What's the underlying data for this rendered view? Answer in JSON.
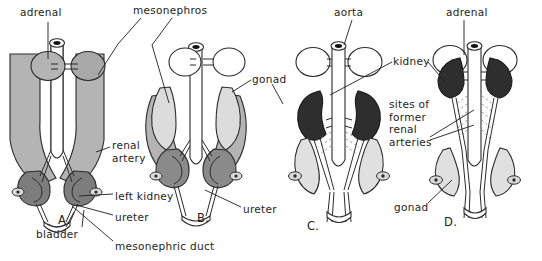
{
  "figure": {
    "width": 542,
    "height": 261,
    "background": "#ffffff",
    "ink": "#1d1d1d"
  },
  "colors": {
    "outline": "#2b2b2b",
    "mesonephros_gray": "#b4b4b4",
    "mesonephros_dark": "#8f8f8f",
    "gonad_light": "#d9d9d9",
    "gonad_pale": "#e2e2e2",
    "kidney_mid": "#7d7d7d",
    "kidney_dark": "#2e2e2e",
    "vessel_white": "#ffffff",
    "dotted_gray": "#9a9a9a"
  },
  "panels": [
    {
      "id": "A",
      "letter": "A.",
      "x": 58,
      "y": 213,
      "stage": "mesonephros with metanephric kidneys low in pelvis"
    },
    {
      "id": "B",
      "letter": "B.",
      "x": 197,
      "y": 211,
      "stage": "regressing mesonephros, kidneys beginning to ascend"
    },
    {
      "id": "C",
      "letter": "C.",
      "x": 307,
      "y": 219,
      "stage": "kidneys ascended, gonads descending"
    },
    {
      "id": "D",
      "letter": "D.",
      "x": 444,
      "y": 215,
      "stage": "kidneys in final position beneath adrenals"
    }
  ],
  "labels": [
    {
      "name": "adrenal-left",
      "text": "adrenal",
      "x": 20,
      "y": 6,
      "align": "left"
    },
    {
      "name": "mesonephros",
      "text": "mesonephros",
      "x": 133,
      "y": 4,
      "align": "left"
    },
    {
      "name": "gonad-b",
      "text": "gonad",
      "x": 252,
      "y": 73,
      "align": "left"
    },
    {
      "name": "renal-artery",
      "text": "renal\nartery",
      "x": 112,
      "y": 139,
      "align": "left"
    },
    {
      "name": "left-kidney",
      "text": "left kidney",
      "x": 115,
      "y": 190,
      "align": "left"
    },
    {
      "name": "ureter-a",
      "text": "ureter",
      "x": 115,
      "y": 211,
      "align": "left"
    },
    {
      "name": "bladder",
      "text": "bladder",
      "x": 36,
      "y": 228,
      "align": "left"
    },
    {
      "name": "mesonephric-duct",
      "text": "mesonephric duct",
      "x": 115,
      "y": 240,
      "align": "left"
    },
    {
      "name": "ureter-b",
      "text": "ureter",
      "x": 243,
      "y": 203,
      "align": "left"
    },
    {
      "name": "aorta",
      "text": "aorta",
      "x": 334,
      "y": 6,
      "align": "left"
    },
    {
      "name": "adrenal-right",
      "text": "adrenal",
      "x": 446,
      "y": 6,
      "align": "left"
    },
    {
      "name": "kidney",
      "text": "kidney",
      "x": 393,
      "y": 55,
      "align": "left"
    },
    {
      "name": "sites-former-renal-arteries",
      "text": "sites of\nformer\nrenal\narteries",
      "x": 389,
      "y": 98,
      "align": "left"
    },
    {
      "name": "gonad-d",
      "text": "gonad",
      "x": 394,
      "y": 201,
      "align": "left"
    }
  ],
  "leaders": [
    {
      "name": "leader-adrenal-left",
      "d": "M48 22 L48 59"
    },
    {
      "name": "leader-mesonephros-1",
      "d": "M141 18 L118 44 L98 75"
    },
    {
      "name": "leader-mesonephros-2",
      "d": "M172 18 L152 45 L169 103"
    },
    {
      "name": "leader-gonad-b",
      "d": "M251 80 L232 92"
    },
    {
      "name": "leader-gonad-b2",
      "d": "M272 84 L283 104"
    },
    {
      "name": "leader-renal-artery",
      "d": "M110 147 L96 152"
    },
    {
      "name": "leader-left-kidney",
      "d": "M113 194 L79 196"
    },
    {
      "name": "leader-ureter-a",
      "d": "M113 215 L76 205"
    },
    {
      "name": "leader-bladder",
      "d": "M66 227 L74 212"
    },
    {
      "name": "leader-bladder-2",
      "d": "M82 227 L84 210"
    },
    {
      "name": "leader-mesonephric-duct",
      "d": "M113 241 L72 206"
    },
    {
      "name": "leader-ureter-b",
      "d": "M241 207 L205 190"
    },
    {
      "name": "leader-aorta",
      "d": "M352 20 L344 45"
    },
    {
      "name": "leader-adrenal-right",
      "d": "M464 20 L464 55"
    },
    {
      "name": "leader-kidney-c",
      "d": "M392 62 L330 95"
    },
    {
      "name": "leader-kidney-d",
      "d": "M428 62 L445 82"
    },
    {
      "name": "leader-sites-1",
      "d": "M430 137 L474 110"
    },
    {
      "name": "leader-sites-2",
      "d": "M430 140 L474 125"
    },
    {
      "name": "leader-gonad-d",
      "d": "M428 203 L452 180"
    }
  ]
}
